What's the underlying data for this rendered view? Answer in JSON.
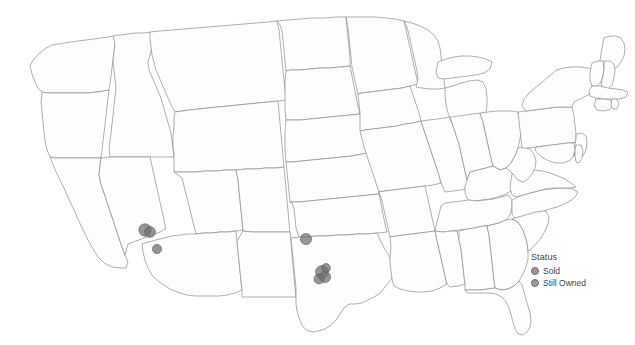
{
  "chart_data": {
    "type": "scatter",
    "title": "",
    "subtitle": "",
    "xlabel": "",
    "ylabel": "",
    "map_region": "United States (contiguous 48 states)",
    "projection": "albers-usa",
    "grid": false,
    "legend": {
      "title": "Status",
      "position": "right",
      "entries": [
        {
          "label": "Sold",
          "color": "#6e6e6e"
        },
        {
          "label": "Still Owned",
          "color": "#6e6e6e"
        }
      ]
    },
    "series": [
      {
        "name": "Status",
        "points": [
          {
            "name": "Phoenix, AZ",
            "state": "Arizona",
            "x": 145,
            "y": 230,
            "r": 6.2,
            "status": "Sold",
            "overlap": true
          },
          {
            "name": "Phoenix metro, AZ",
            "state": "Arizona",
            "x": 150,
            "y": 232,
            "r": 5.4,
            "status": "Still Owned",
            "overlap": true
          },
          {
            "name": "Tucson, AZ",
            "state": "Arizona",
            "x": 157,
            "y": 249,
            "r": 4.6,
            "status": "Sold",
            "overlap": false
          },
          {
            "name": "Dallas-Fort Worth, TX",
            "state": "Texas",
            "x": 306,
            "y": 239,
            "r": 5.6,
            "status": "Sold",
            "overlap": false
          },
          {
            "name": "Houston, TX",
            "state": "Texas",
            "x": 322,
            "y": 272,
            "r": 6.4,
            "status": "Sold",
            "overlap": true
          },
          {
            "name": "Houston metro A, TX",
            "state": "Texas",
            "x": 325,
            "y": 277,
            "r": 5.6,
            "status": "Still Owned",
            "overlap": true
          },
          {
            "name": "Houston metro B, TX",
            "state": "Texas",
            "x": 319,
            "y": 279,
            "r": 5.0,
            "status": "Sold",
            "overlap": true
          },
          {
            "name": "Houston metro C, TX",
            "state": "Texas",
            "x": 326,
            "y": 268,
            "r": 4.4,
            "status": "Still Owned",
            "overlap": true
          }
        ]
      }
    ],
    "colors": {
      "marker_fill": "#6e6e6e",
      "marker_stroke": "#5a5a5a",
      "state_fill": "#fdfdfd",
      "state_stroke": "#8d8d8d",
      "background": "#ffffff",
      "text": "#3f3f3f"
    },
    "annotations": []
  },
  "legend": {
    "title": "Status",
    "items": [
      {
        "label": "Sold"
      },
      {
        "label": "Still Owned"
      }
    ]
  },
  "caption": ""
}
